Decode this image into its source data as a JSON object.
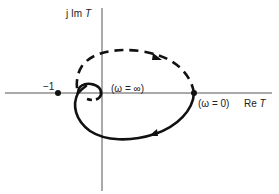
{
  "diagram": {
    "type": "nyquist-plot",
    "axes": {
      "imag_label_prefix": "j Im ",
      "imag_label_var": "T",
      "real_label_prefix": "Re ",
      "real_label_var": "T"
    },
    "points": {
      "critical": {
        "label": "−1"
      },
      "omega_zero": {
        "label": "(ω = 0)"
      },
      "omega_inf": {
        "label": "(ω = ∞)"
      }
    },
    "curves": [
      {
        "name": "positive-frequency-branch",
        "style": "solid",
        "direction": "clockwise-from-omega-0"
      },
      {
        "name": "negative-frequency-branch",
        "style": "dashed",
        "direction": "toward-omega-0"
      }
    ],
    "colors": {
      "ink": "#111111",
      "axis": "#555555",
      "background": "#ffffff"
    }
  }
}
